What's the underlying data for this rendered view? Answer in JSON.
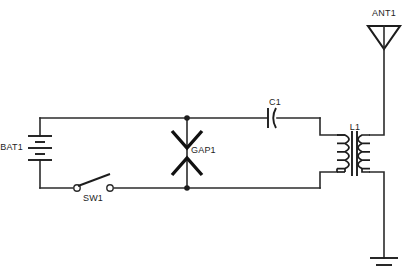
{
  "diagram": {
    "type": "electronic-schematic",
    "background_color": "#ffffff",
    "line_color": "#1d1d1d",
    "canvas": {
      "width": 406,
      "height": 280
    }
  },
  "components": {
    "battery": {
      "ref": "BAT1",
      "symbol": "battery-multicell",
      "label_x": 23,
      "label_y": 148,
      "plates": 3
    },
    "switch": {
      "ref": "SW1",
      "symbol": "spst-switch-open",
      "label_x": 93,
      "label_y": 201,
      "state": "open"
    },
    "spark_gap": {
      "ref": "GAP1",
      "symbol": "spark-gap-arrows",
      "label_x": 191,
      "label_y": 153
    },
    "capacitor": {
      "ref": "C1",
      "symbol": "capacitor-polarized",
      "label_x": 278,
      "label_y": 105
    },
    "transformer": {
      "ref": "L1",
      "symbol": "transformer-iron-core",
      "label_x": 356,
      "label_y": 133,
      "primary_turns": 4,
      "secondary_turns": 4
    },
    "antenna": {
      "ref": "ANT1",
      "symbol": "antenna-triangle",
      "label_x": 384,
      "label_y": 13
    },
    "ground": {
      "ref": "",
      "symbol": "earth-ground",
      "bars": 2
    }
  },
  "nodes": [
    {
      "name": "gap-top-junction",
      "x": 187,
      "y": 118
    },
    {
      "name": "gap-bottom-junction",
      "x": 187,
      "y": 188
    }
  ]
}
